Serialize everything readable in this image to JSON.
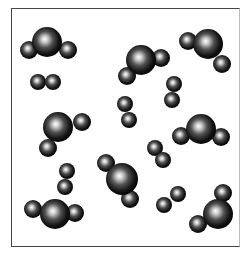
{
  "diagram": {
    "title": "",
    "colors": {
      "sphere_dark": "#000000",
      "sphere_highlight": "#ffffff",
      "border": "#444444"
    },
    "molecules": [
      {
        "type": "triatomic",
        "atoms": [
          {
            "x": 47,
            "y": 42,
            "r": 15
          },
          {
            "x": 29,
            "y": 50,
            "r": 9
          },
          {
            "x": 68,
            "y": 50,
            "r": 9
          }
        ]
      },
      {
        "type": "diatomic",
        "atoms": [
          {
            "x": 38,
            "y": 82,
            "r": 8
          },
          {
            "x": 53,
            "y": 82,
            "r": 8
          }
        ]
      },
      {
        "type": "triatomic",
        "atoms": [
          {
            "x": 141,
            "y": 60,
            "r": 15
          },
          {
            "x": 161,
            "y": 58,
            "r": 9
          },
          {
            "x": 127,
            "y": 76,
            "r": 9
          }
        ]
      },
      {
        "type": "triatomic",
        "atoms": [
          {
            "x": 208,
            "y": 44,
            "r": 15
          },
          {
            "x": 188,
            "y": 41,
            "r": 9
          },
          {
            "x": 222,
            "y": 64,
            "r": 9
          }
        ]
      },
      {
        "type": "diatomic",
        "atoms": [
          {
            "x": 174,
            "y": 84,
            "r": 8
          },
          {
            "x": 172,
            "y": 100,
            "r": 8
          }
        ]
      },
      {
        "type": "diatomic",
        "atoms": [
          {
            "x": 125,
            "y": 104,
            "r": 8
          },
          {
            "x": 129,
            "y": 120,
            "r": 8
          }
        ]
      },
      {
        "type": "triatomic",
        "atoms": [
          {
            "x": 58,
            "y": 127,
            "r": 15
          },
          {
            "x": 82,
            "y": 122,
            "r": 9
          },
          {
            "x": 48,
            "y": 148,
            "r": 9
          }
        ]
      },
      {
        "type": "triatomic",
        "atoms": [
          {
            "x": 201,
            "y": 129,
            "r": 15
          },
          {
            "x": 181,
            "y": 136,
            "r": 9
          },
          {
            "x": 221,
            "y": 137,
            "r": 9
          }
        ]
      },
      {
        "type": "diatomic",
        "atoms": [
          {
            "x": 155,
            "y": 148,
            "r": 8
          },
          {
            "x": 163,
            "y": 160,
            "r": 8
          }
        ]
      },
      {
        "type": "diatomic",
        "atoms": [
          {
            "x": 67,
            "y": 171,
            "r": 8
          },
          {
            "x": 65,
            "y": 187,
            "r": 8
          }
        ]
      },
      {
        "type": "triatomic",
        "atoms": [
          {
            "x": 122,
            "y": 179,
            "r": 16
          },
          {
            "x": 106,
            "y": 163,
            "r": 9
          },
          {
            "x": 130,
            "y": 199,
            "r": 9
          }
        ]
      },
      {
        "type": "diatomic",
        "atoms": [
          {
            "x": 164,
            "y": 205,
            "r": 8
          },
          {
            "x": 178,
            "y": 194,
            "r": 8
          }
        ]
      },
      {
        "type": "triatomic",
        "atoms": [
          {
            "x": 55,
            "y": 214,
            "r": 15
          },
          {
            "x": 33,
            "y": 209,
            "r": 9
          },
          {
            "x": 75,
            "y": 213,
            "r": 9
          }
        ]
      },
      {
        "type": "triatomic",
        "atoms": [
          {
            "x": 218,
            "y": 214,
            "r": 15
          },
          {
            "x": 223,
            "y": 193,
            "r": 9
          },
          {
            "x": 198,
            "y": 224,
            "r": 9
          }
        ]
      }
    ]
  }
}
